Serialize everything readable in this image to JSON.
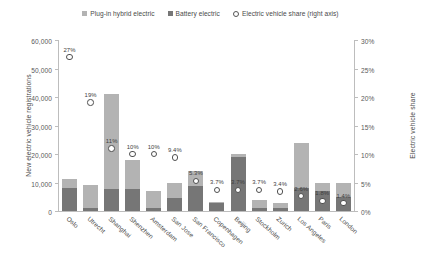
{
  "chart_data": {
    "type": "bar",
    "title": "",
    "subtitle": "",
    "xlabel": "",
    "ylabel": "New electric vehicle registrations",
    "ylabel_right": "Electric vehicle share",
    "ylim": [
      0,
      60000
    ],
    "ylim_right": [
      0,
      30
    ],
    "grid": false,
    "legend_position": "top-center",
    "stacked": true,
    "categories": [
      "Oslo",
      "Utrecht",
      "Shanghai",
      "Shenzhen",
      "Amsterdam",
      "San Jose",
      "San Francisco",
      "Copenhagen",
      "Beijing",
      "Stockholm",
      "Zurich",
      "Los Angeles",
      "Paris",
      "London"
    ],
    "series": [
      {
        "name": "Battery electric",
        "color": "#767676",
        "axis": "left",
        "values": [
          8200,
          900,
          7800,
          7800,
          900,
          4600,
          8700,
          2800,
          19000,
          1000,
          900,
          8000,
          6900,
          4800
        ]
      },
      {
        "name": "Plug-in hybrid electric",
        "color": "#b3b3b3",
        "axis": "left",
        "values": [
          2900,
          8300,
          33200,
          10000,
          6100,
          5400,
          5200,
          400,
          1000,
          2700,
          1900,
          16000,
          3000,
          5100
        ]
      },
      {
        "name": "Electric vehicle share (right axis)",
        "color": "#4f4f4f",
        "axis": "right",
        "marker": "circle-open",
        "values": [
          27,
          19,
          11,
          10,
          10,
          9.4,
          5.3,
          3.7,
          3.7,
          3.7,
          3.4,
          2.6,
          1.8,
          1.4
        ],
        "value_labels": [
          "27%",
          "19%",
          "11%",
          "10%",
          "10%",
          "9.4%",
          "5.3%",
          "3.7%",
          "3.7%",
          "3.7%",
          "3.4%",
          "2.6%",
          "1.8%",
          "1.4%"
        ]
      }
    ],
    "yticks_left": [
      "0",
      "10,000",
      "20,000",
      "30,000",
      "40,000",
      "50,000",
      "60,000"
    ],
    "ytick_values_left": [
      0,
      10000,
      20000,
      30000,
      40000,
      50000,
      60000
    ],
    "yticks_right": [
      "0%",
      "5%",
      "10%",
      "15%",
      "20%",
      "25%",
      "30%"
    ],
    "ytick_values_right": [
      0,
      5,
      10,
      15,
      20,
      25,
      30
    ]
  },
  "legend": {
    "items": [
      {
        "label": "Plug-in hybrid electric",
        "color": "#b3b3b3",
        "marker": "square"
      },
      {
        "label": "Battery electric",
        "color": "#767676",
        "marker": "square"
      },
      {
        "label": "Electric vehicle share (right axis)",
        "color": "#4f4f4f",
        "marker": "circle-open"
      }
    ]
  },
  "axes": {
    "left_title": "New electric vehicle registrations",
    "right_title": "Electric vehicle share"
  },
  "colors": {
    "plugin_hybrid": "#b3b3b3",
    "battery_electric": "#767676",
    "share_marker": "#4f4f4f",
    "axis": "#bdbdbd",
    "text": "#4a4a4a",
    "background": "#ffffff"
  }
}
